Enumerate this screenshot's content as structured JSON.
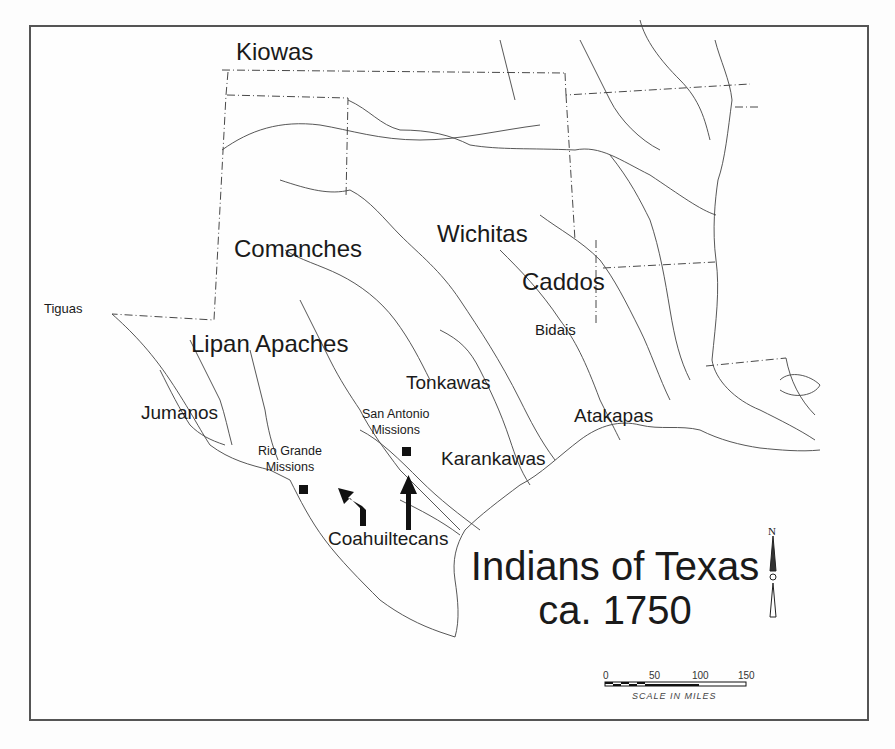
{
  "map": {
    "title_line1": "Indians of Texas",
    "title_line2": "ca. 1750",
    "tribes": [
      {
        "name": "Kiowas"
      },
      {
        "name": "Comanches"
      },
      {
        "name": "Wichitas"
      },
      {
        "name": "Caddos"
      },
      {
        "name": "Bidais"
      },
      {
        "name": "Tiguas"
      },
      {
        "name": "Lipan Apaches"
      },
      {
        "name": "Tonkawas"
      },
      {
        "name": "Jumanos"
      },
      {
        "name": "Atakapas"
      },
      {
        "name": "Karankawas"
      },
      {
        "name": "Coahuiltecans"
      }
    ],
    "missions": [
      {
        "line1": "San Antonio",
        "line2": "Missions"
      },
      {
        "line1": "Rio Grande",
        "line2": "Missions"
      }
    ],
    "north_arrow": {
      "label": "N"
    },
    "scale": {
      "ticks": [
        "0",
        "50",
        "100",
        "150"
      ],
      "caption": "SCALE IN MILES"
    },
    "colors": {
      "ink": "#1a1a1a",
      "frame": "#555555",
      "background": "#fefefe"
    }
  }
}
